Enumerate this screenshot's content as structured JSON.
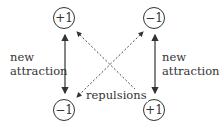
{
  "nodes": {
    "top_left": "+1",
    "top_right": "−1",
    "bottom_left": "−1",
    "bottom_right": "+1"
  },
  "labels": {
    "left_line1": "new",
    "left_line2": "attraction",
    "right_line1": "new",
    "right_line2": "attraction",
    "center": "repulsions"
  },
  "colors": {
    "stroke": "#333333"
  }
}
